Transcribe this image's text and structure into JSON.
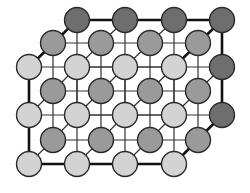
{
  "diagram": {
    "type": "crystal-lattice",
    "colors": {
      "background": "#ffffff",
      "front_layer": "#d3d3d3",
      "middle_layer": "#9a9a9a",
      "back_layer": "#6e6e6e",
      "outline": "#2a2a2a",
      "edge_thick": "#111111",
      "edge_thin": "#333333"
    },
    "radius": 12.5,
    "layers": [
      {
        "name": "back",
        "fill_key": "back_layer",
        "xs": [
          77,
          125,
          174,
          222
        ],
        "ys": [
          20,
          67,
          115
        ],
        "visible_nodes": [
          [
            77,
            20
          ],
          [
            125,
            20
          ],
          [
            174,
            20
          ],
          [
            222,
            20
          ],
          [
            222,
            67
          ],
          [
            222,
            115
          ]
        ]
      },
      {
        "name": "middle",
        "fill_key": "middle_layer",
        "xs": [
          53,
          101,
          150,
          198
        ],
        "ys": [
          43,
          91,
          140
        ]
      },
      {
        "name": "front",
        "fill_key": "front_layer",
        "xs": [
          29,
          77,
          125,
          174
        ],
        "ys": [
          67,
          115,
          164
        ]
      }
    ]
  }
}
